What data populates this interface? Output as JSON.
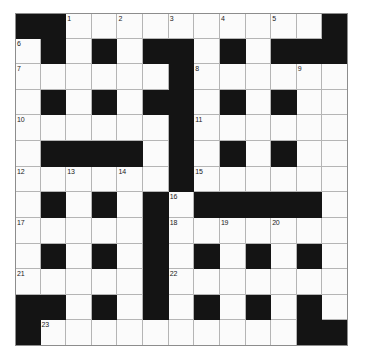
{
  "puzzle": {
    "title": "Crossword Grid",
    "rows": 13,
    "cols": 13,
    "colors": {
      "block": "#141414",
      "cell": "#fbfbfb",
      "gridline": "#b5b5b5",
      "number_text": "#1a1a1a",
      "page_background": "#ffffff"
    },
    "layout_legend": {
      "1": "white (writable square)",
      "0": "black (blocked square)"
    },
    "grid": [
      [
        0,
        0,
        1,
        1,
        1,
        1,
        1,
        1,
        1,
        1,
        1,
        1,
        0
      ],
      [
        1,
        0,
        1,
        0,
        1,
        0,
        0,
        1,
        0,
        1,
        0,
        0,
        0
      ],
      [
        1,
        1,
        1,
        1,
        1,
        1,
        0,
        1,
        1,
        1,
        1,
        1,
        1
      ],
      [
        1,
        0,
        1,
        0,
        1,
        0,
        0,
        1,
        0,
        1,
        0,
        1,
        1
      ],
      [
        1,
        1,
        1,
        1,
        1,
        1,
        0,
        1,
        1,
        1,
        1,
        1,
        1
      ],
      [
        1,
        0,
        0,
        0,
        0,
        1,
        0,
        1,
        0,
        1,
        0,
        1,
        1
      ],
      [
        1,
        1,
        1,
        1,
        1,
        1,
        0,
        1,
        1,
        1,
        1,
        1,
        1
      ],
      [
        1,
        0,
        1,
        0,
        1,
        0,
        1,
        0,
        0,
        0,
        0,
        0,
        1
      ],
      [
        1,
        1,
        1,
        1,
        1,
        0,
        1,
        1,
        1,
        1,
        1,
        1,
        1
      ],
      [
        1,
        0,
        1,
        0,
        1,
        0,
        1,
        0,
        1,
        0,
        1,
        0,
        1
      ],
      [
        1,
        1,
        1,
        1,
        1,
        0,
        1,
        1,
        1,
        1,
        1,
        1,
        1
      ],
      [
        0,
        0,
        1,
        0,
        1,
        0,
        1,
        0,
        1,
        0,
        1,
        0,
        1
      ],
      [
        0,
        1,
        1,
        1,
        1,
        1,
        1,
        1,
        1,
        1,
        1,
        0,
        0
      ]
    ],
    "numbers": [
      {
        "n": "1",
        "row": 0,
        "col": 2
      },
      {
        "n": "2",
        "row": 0,
        "col": 4
      },
      {
        "n": "3",
        "row": 0,
        "col": 6
      },
      {
        "n": "4",
        "row": 0,
        "col": 8
      },
      {
        "n": "5",
        "row": 0,
        "col": 10
      },
      {
        "n": "6",
        "row": 1,
        "col": 0
      },
      {
        "n": "7",
        "row": 2,
        "col": 0
      },
      {
        "n": "8",
        "row": 2,
        "col": 7
      },
      {
        "n": "9",
        "row": 2,
        "col": 11
      },
      {
        "n": "10",
        "row": 4,
        "col": 0
      },
      {
        "n": "11",
        "row": 4,
        "col": 7
      },
      {
        "n": "12",
        "row": 6,
        "col": 0
      },
      {
        "n": "13",
        "row": 6,
        "col": 2
      },
      {
        "n": "14",
        "row": 6,
        "col": 4
      },
      {
        "n": "15",
        "row": 6,
        "col": 7
      },
      {
        "n": "16",
        "row": 7,
        "col": 6
      },
      {
        "n": "17",
        "row": 8,
        "col": 0
      },
      {
        "n": "18",
        "row": 8,
        "col": 6
      },
      {
        "n": "19",
        "row": 8,
        "col": 8
      },
      {
        "n": "20",
        "row": 8,
        "col": 10
      },
      {
        "n": "21",
        "row": 10,
        "col": 0
      },
      {
        "n": "22",
        "row": 10,
        "col": 6
      },
      {
        "n": "23",
        "row": 12,
        "col": 1
      }
    ]
  }
}
